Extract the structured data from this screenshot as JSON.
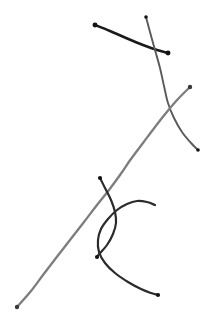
{
  "canvas": {
    "width": 214,
    "height": 323,
    "background_color": "#ffffff",
    "description": "Hand-drawn sketch of five overlapping pen strokes"
  },
  "palette": {
    "near_black": "#1a1a1a",
    "dark_gray": "#3d3d3d",
    "mid_gray": "#6e6e6e",
    "light_mid_gray": "#8a8a8a"
  },
  "chart_data": {
    "type": "line",
    "title": "",
    "xlabel": "",
    "ylabel": "",
    "grid": false,
    "legend_position": "none",
    "xlim": [
      0,
      214
    ],
    "ylim": [
      0,
      323
    ],
    "series": [
      {
        "name": "stroke-1-short-straight",
        "color": "#1a1a1a",
        "width": 2.6,
        "closed": false,
        "start_dot": true,
        "end_dot": true,
        "points": [
          [
            95,
            25
          ],
          [
            110,
            31
          ],
          [
            126,
            38
          ],
          [
            143,
            45
          ],
          [
            157,
            50
          ],
          [
            168,
            53
          ]
        ]
      },
      {
        "name": "stroke-2-descending-curve",
        "color": "#5a5a5a",
        "width": 1.9,
        "closed": false,
        "start_dot": true,
        "end_dot": true,
        "points": [
          [
            146,
            17
          ],
          [
            150,
            32
          ],
          [
            155,
            50
          ],
          [
            160,
            68
          ],
          [
            164,
            86
          ],
          [
            168,
            103
          ],
          [
            174,
            118
          ],
          [
            182,
            132
          ],
          [
            191,
            143
          ],
          [
            198,
            150
          ]
        ]
      },
      {
        "name": "stroke-3-long-sweep",
        "color": "#7d7d7d",
        "width": 2.3,
        "closed": false,
        "start_dot": true,
        "end_dot": true,
        "points": [
          [
            190,
            87
          ],
          [
            178,
            99
          ],
          [
            166,
            113
          ],
          [
            155,
            127
          ],
          [
            143,
            143
          ],
          [
            131,
            159
          ],
          [
            120,
            175
          ],
          [
            109,
            190
          ],
          [
            97,
            205
          ],
          [
            84,
            222
          ],
          [
            70,
            240
          ],
          [
            56,
            258
          ],
          [
            43,
            275
          ],
          [
            31,
            291
          ],
          [
            17,
            307
          ]
        ]
      },
      {
        "name": "stroke-4-short-bow",
        "color": "#2b2b2b",
        "width": 2.2,
        "closed": false,
        "start_dot": true,
        "end_dot": true,
        "points": [
          [
            100,
            178
          ],
          [
            105,
            188
          ],
          [
            111,
            200
          ],
          [
            115,
            212
          ],
          [
            116,
            223
          ],
          [
            113,
            234
          ],
          [
            107,
            245
          ],
          [
            100,
            253
          ],
          [
            97,
            257
          ]
        ]
      },
      {
        "name": "stroke-5-hook-arc",
        "color": "#2b2b2b",
        "width": 2.2,
        "closed": false,
        "start_dot": false,
        "end_dot": true,
        "points": [
          [
            155,
            205
          ],
          [
            147,
            202
          ],
          [
            137,
            201
          ],
          [
            127,
            204
          ],
          [
            117,
            210
          ],
          [
            108,
            219
          ],
          [
            101,
            229
          ],
          [
            98,
            240
          ],
          [
            99,
            252
          ],
          [
            105,
            263
          ],
          [
            115,
            273
          ],
          [
            128,
            282
          ],
          [
            141,
            289
          ],
          [
            151,
            293
          ],
          [
            158,
            295
          ]
        ]
      }
    ]
  }
}
